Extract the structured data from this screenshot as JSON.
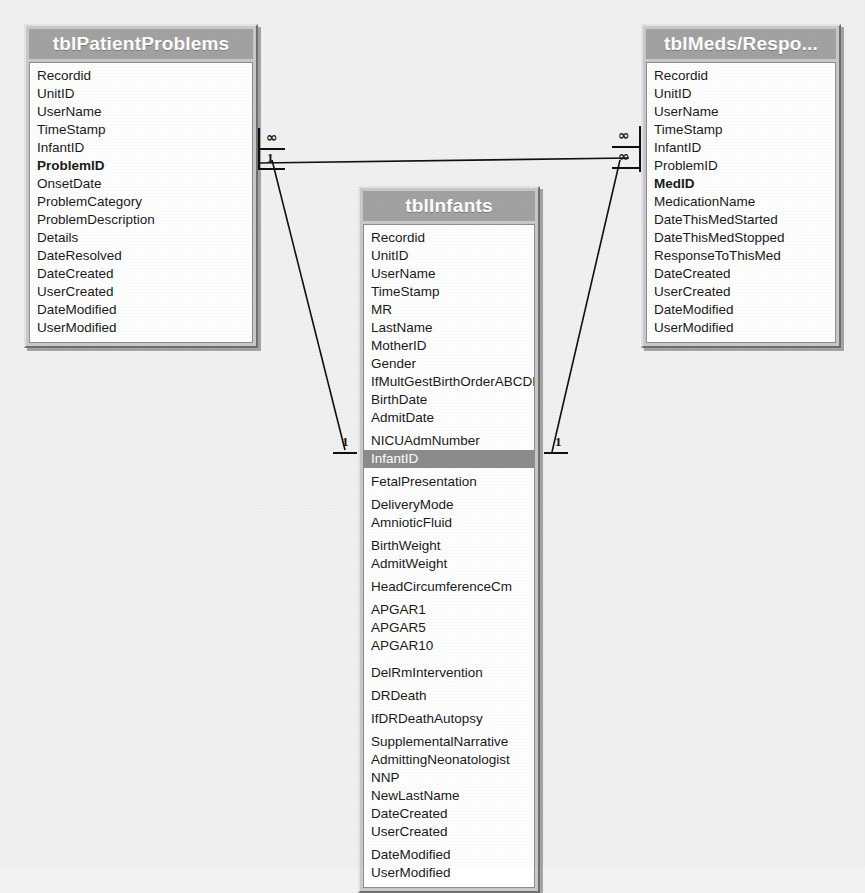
{
  "diagram": {
    "background_color": "#f1f1f1",
    "title_bar_color": "#a2a2a2",
    "selected_row_color": "#8c8c8c"
  },
  "tables": [
    {
      "id": "tblPatientProblems",
      "title": "tblPatientProblems",
      "fields": [
        {
          "name": "Recordid",
          "key": false,
          "selected": false,
          "gap": "none"
        },
        {
          "name": "UnitID",
          "key": false,
          "selected": false,
          "gap": "none"
        },
        {
          "name": "UserName",
          "key": false,
          "selected": false,
          "gap": "none"
        },
        {
          "name": "TimeStamp",
          "key": false,
          "selected": false,
          "gap": "none"
        },
        {
          "name": "InfantID",
          "key": false,
          "selected": false,
          "gap": "none"
        },
        {
          "name": "ProblemID",
          "key": true,
          "selected": false,
          "gap": "none"
        },
        {
          "name": "OnsetDate",
          "key": false,
          "selected": false,
          "gap": "none"
        },
        {
          "name": "ProblemCategory",
          "key": false,
          "selected": false,
          "gap": "none"
        },
        {
          "name": "ProblemDescription",
          "key": false,
          "selected": false,
          "gap": "none"
        },
        {
          "name": "Details",
          "key": false,
          "selected": false,
          "gap": "none"
        },
        {
          "name": "DateResolved",
          "key": false,
          "selected": false,
          "gap": "none"
        },
        {
          "name": "DateCreated",
          "key": false,
          "selected": false,
          "gap": "none"
        },
        {
          "name": "UserCreated",
          "key": false,
          "selected": false,
          "gap": "none"
        },
        {
          "name": "DateModified",
          "key": false,
          "selected": false,
          "gap": "none"
        },
        {
          "name": "UserModified",
          "key": false,
          "selected": false,
          "gap": "none"
        }
      ]
    },
    {
      "id": "tblInfants",
      "title": "tblInfants",
      "fields": [
        {
          "name": "Recordid",
          "key": false,
          "selected": false,
          "gap": "none"
        },
        {
          "name": "UnitID",
          "key": false,
          "selected": false,
          "gap": "none"
        },
        {
          "name": "UserName",
          "key": false,
          "selected": false,
          "gap": "none"
        },
        {
          "name": "TimeStamp",
          "key": false,
          "selected": false,
          "gap": "none"
        },
        {
          "name": "MR",
          "key": false,
          "selected": false,
          "gap": "none"
        },
        {
          "name": "LastName",
          "key": false,
          "selected": false,
          "gap": "none"
        },
        {
          "name": "MotherID",
          "key": false,
          "selected": false,
          "gap": "none"
        },
        {
          "name": "Gender",
          "key": false,
          "selected": false,
          "gap": "none"
        },
        {
          "name": "IfMultGestBirthOrderABCDE",
          "key": false,
          "selected": false,
          "gap": "none"
        },
        {
          "name": "BirthDate",
          "key": false,
          "selected": false,
          "gap": "none"
        },
        {
          "name": "AdmitDate",
          "key": false,
          "selected": false,
          "gap": "none"
        },
        {
          "name": "NICUAdmNumber",
          "key": false,
          "selected": false,
          "gap": "sm"
        },
        {
          "name": "InfantID",
          "key": false,
          "selected": true,
          "gap": "none"
        },
        {
          "name": "FetalPresentation",
          "key": false,
          "selected": false,
          "gap": "sm"
        },
        {
          "name": "DeliveryMode",
          "key": false,
          "selected": false,
          "gap": "sm"
        },
        {
          "name": "AmnioticFluid",
          "key": false,
          "selected": false,
          "gap": "none"
        },
        {
          "name": "BirthWeight",
          "key": false,
          "selected": false,
          "gap": "sm"
        },
        {
          "name": "AdmitWeight",
          "key": false,
          "selected": false,
          "gap": "none"
        },
        {
          "name": "HeadCircumferenceCm",
          "key": false,
          "selected": false,
          "gap": "sm"
        },
        {
          "name": "APGAR1",
          "key": false,
          "selected": false,
          "gap": "sm"
        },
        {
          "name": "APGAR5",
          "key": false,
          "selected": false,
          "gap": "none"
        },
        {
          "name": "APGAR10",
          "key": false,
          "selected": false,
          "gap": "none"
        },
        {
          "name": "DelRmIntervention",
          "key": false,
          "selected": false,
          "gap": "md"
        },
        {
          "name": "DRDeath",
          "key": false,
          "selected": false,
          "gap": "sm"
        },
        {
          "name": "IfDRDeathAutopsy",
          "key": false,
          "selected": false,
          "gap": "sm"
        },
        {
          "name": "SupplementalNarrative",
          "key": false,
          "selected": false,
          "gap": "sm"
        },
        {
          "name": "AdmittingNeonatologist",
          "key": false,
          "selected": false,
          "gap": "none"
        },
        {
          "name": "NNP",
          "key": false,
          "selected": false,
          "gap": "none"
        },
        {
          "name": "NewLastName",
          "key": false,
          "selected": false,
          "gap": "none"
        },
        {
          "name": "DateCreated",
          "key": false,
          "selected": false,
          "gap": "none"
        },
        {
          "name": "UserCreated",
          "key": false,
          "selected": false,
          "gap": "none"
        },
        {
          "name": "DateModified",
          "key": false,
          "selected": false,
          "gap": "sm"
        },
        {
          "name": "UserModified",
          "key": false,
          "selected": false,
          "gap": "none"
        }
      ]
    },
    {
      "id": "tblMedsResponses",
      "title": "tblMeds/Respo...",
      "fields": [
        {
          "name": "Recordid",
          "key": false,
          "selected": false,
          "gap": "none"
        },
        {
          "name": "UnitID",
          "key": false,
          "selected": false,
          "gap": "none"
        },
        {
          "name": "UserName",
          "key": false,
          "selected": false,
          "gap": "none"
        },
        {
          "name": "TimeStamp",
          "key": false,
          "selected": false,
          "gap": "none"
        },
        {
          "name": "InfantID",
          "key": false,
          "selected": false,
          "gap": "none"
        },
        {
          "name": "ProblemID",
          "key": false,
          "selected": false,
          "gap": "none"
        },
        {
          "name": "MedID",
          "key": true,
          "selected": false,
          "gap": "none"
        },
        {
          "name": "MedicationName",
          "key": false,
          "selected": false,
          "gap": "none"
        },
        {
          "name": "DateThisMedStarted",
          "key": false,
          "selected": false,
          "gap": "none"
        },
        {
          "name": "DateThisMedStopped",
          "key": false,
          "selected": false,
          "gap": "none"
        },
        {
          "name": "ResponseToThisMed",
          "key": false,
          "selected": false,
          "gap": "none"
        },
        {
          "name": "DateCreated",
          "key": false,
          "selected": false,
          "gap": "none"
        },
        {
          "name": "UserCreated",
          "key": false,
          "selected": false,
          "gap": "none"
        },
        {
          "name": "DateModified",
          "key": false,
          "selected": false,
          "gap": "none"
        },
        {
          "name": "UserModified",
          "key": false,
          "selected": false,
          "gap": "none"
        }
      ]
    }
  ],
  "cardinality_markers": {
    "left_top_many": "∞",
    "left_top_one": "1",
    "right_top_many_upper": "∞",
    "right_top_many_lower": "∞",
    "left_bottom_one": "1",
    "right_bottom_one": "1"
  }
}
